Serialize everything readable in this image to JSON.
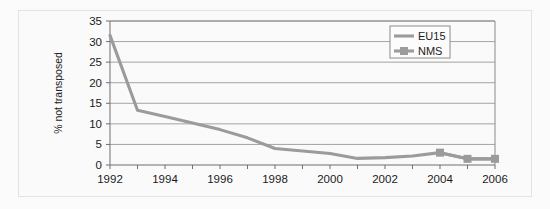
{
  "chart_data": {
    "type": "line",
    "title": "",
    "xlabel": "",
    "ylabel": "% not transposed",
    "xlim": [
      1992,
      2006
    ],
    "ylim": [
      0,
      35
    ],
    "ytick_step": 5,
    "yticks": [
      0,
      5,
      10,
      15,
      20,
      25,
      30,
      35
    ],
    "ytick_labels": [
      "0",
      "5",
      "10",
      "15",
      "20",
      "25",
      "30",
      "35"
    ],
    "xticks": [
      1992,
      1993,
      1994,
      1995,
      1996,
      1997,
      1998,
      1999,
      2000,
      2001,
      2002,
      2003,
      2004,
      2005,
      2006
    ],
    "xtick_labels_shown": [
      "1992",
      "1994",
      "1996",
      "1998",
      "2000",
      "2002",
      "2004",
      "2006"
    ],
    "grid": "horizontal",
    "legend_position": "top-right",
    "series": [
      {
        "name": "EU15",
        "marker": "none",
        "color": "#9b9b9b",
        "x": [
          1992,
          1993,
          1994,
          1995,
          1996,
          1997,
          1998,
          1999,
          2000,
          2001,
          2002,
          2003,
          2004,
          2005,
          2006
        ],
        "values": [
          31.5,
          13.3,
          11.8,
          10.2,
          8.6,
          6.6,
          4.0,
          3.4,
          2.8,
          1.6,
          1.8,
          2.2,
          3.0,
          1.5,
          1.5
        ]
      },
      {
        "name": "NMS",
        "marker": "square",
        "color": "#9b9b9b",
        "x": [
          2004,
          2005,
          2006
        ],
        "values": [
          3.0,
          1.5,
          1.5
        ]
      }
    ],
    "legend": [
      {
        "label": "EU15",
        "marker": "none"
      },
      {
        "label": "NMS",
        "marker": "square"
      }
    ]
  },
  "axis": {
    "y_title": "% not transposed"
  }
}
